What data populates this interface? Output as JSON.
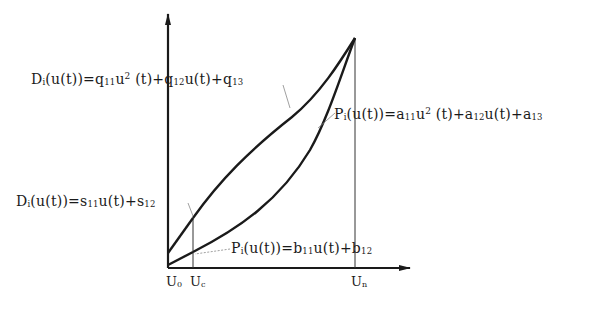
{
  "diagram": {
    "type": "function-curves",
    "axes": {
      "x_ticks": [
        {
          "id": "u0",
          "main": "U",
          "sub": "0"
        },
        {
          "id": "uc",
          "main": "U",
          "sub": "c"
        },
        {
          "id": "un",
          "main": "U",
          "sub": "n"
        }
      ]
    },
    "labels": {
      "d_quadratic": {
        "prefix": "D",
        "prefix_sub": "i",
        "p1": "(u(t))=q",
        "s1": "11",
        "p2": "u",
        "sup": "2",
        "p3": " (t)+q",
        "s2": "12",
        "p4": "u(t)+q",
        "s3": "13"
      },
      "p_quadratic": {
        "prefix": "P",
        "prefix_sub": "i",
        "p1": "(u(t))=a",
        "s1": "11",
        "p2": "u",
        "sup": "2",
        "p3": " (t)+a",
        "s2": "12",
        "p4": "u(t)+a",
        "s3": "13"
      },
      "d_linear": {
        "prefix": "D",
        "prefix_sub": "i",
        "p1": "(u(t))=s",
        "s1": "11",
        "p2": "u(t)+s",
        "s2": "12"
      },
      "p_linear": {
        "prefix": "P",
        "prefix_sub": "i",
        "p1": "(u(t))=b",
        "s1": "11",
        "p2": "u(t)+b",
        "s2": "12"
      }
    },
    "colors": {
      "line": "#1a1a1a",
      "leader": "#888888",
      "background": "#ffffff"
    }
  }
}
